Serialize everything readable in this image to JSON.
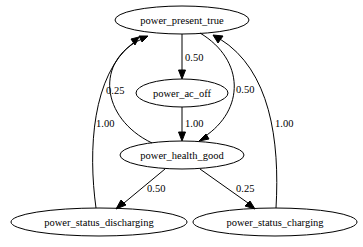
{
  "graph": {
    "type": "state-transition-diagram",
    "nodes": [
      {
        "id": "power_present_true",
        "label": "power_present_true"
      },
      {
        "id": "power_ac_off",
        "label": "power_ac_off"
      },
      {
        "id": "power_health_good",
        "label": "power_health_good"
      },
      {
        "id": "power_status_discharging",
        "label": "power_status_discharging"
      },
      {
        "id": "power_status_charging",
        "label": "power_status_charging"
      }
    ],
    "edges": [
      {
        "from": "power_present_true",
        "to": "power_ac_off",
        "label": "0.50"
      },
      {
        "from": "power_present_true",
        "to": "power_health_good",
        "label": "0.50"
      },
      {
        "from": "power_ac_off",
        "to": "power_health_good",
        "label": "1.00"
      },
      {
        "from": "power_health_good",
        "to": "power_present_true",
        "label": "0.25"
      },
      {
        "from": "power_health_good",
        "to": "power_status_discharging",
        "label": "0.50"
      },
      {
        "from": "power_health_good",
        "to": "power_status_charging",
        "label": "0.25"
      },
      {
        "from": "power_status_discharging",
        "to": "power_present_true",
        "label": "1.00"
      },
      {
        "from": "power_status_charging",
        "to": "power_present_true",
        "label": "1.00"
      }
    ]
  }
}
